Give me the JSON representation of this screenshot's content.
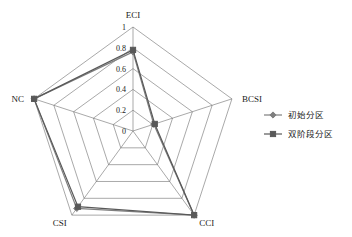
{
  "chart_data": {
    "type": "radar",
    "title": "",
    "categories": [
      "ECI",
      "BCSI",
      "CCI",
      "CSI",
      "NC"
    ],
    "tick_labels": [
      "0",
      "0.2",
      "0.4",
      "0.6",
      "0.8",
      "1"
    ],
    "ticks": [
      0,
      0.2,
      0.4,
      0.6,
      0.8,
      1
    ],
    "rlim": [
      0,
      1
    ],
    "grid": true,
    "legend_position": "right",
    "series": [
      {
        "name": "初始分区",
        "marker": "diamond",
        "color": "#7f7f7f",
        "values": [
          0.76,
          0.21,
          1.0,
          0.92,
          1.0
        ]
      },
      {
        "name": "双阶段分区",
        "marker": "square",
        "color": "#595959",
        "values": [
          0.78,
          0.22,
          1.0,
          0.9,
          1.0
        ]
      }
    ]
  },
  "axes": {
    "labels": [
      {
        "name": "ECI"
      },
      {
        "name": "BCSI"
      },
      {
        "name": "CCI"
      },
      {
        "name": "CSI"
      },
      {
        "name": "NC"
      }
    ]
  },
  "ticks": {
    "t0": "0",
    "t1": "0.2",
    "t2": "0.4",
    "t3": "0.6",
    "t4": "0.8",
    "t5": "1"
  },
  "legend": {
    "items": [
      {
        "label": "初始分区",
        "marker": "diamond-marker",
        "color": "#7f7f7f"
      },
      {
        "label": "双阶段分区",
        "marker": "square-marker",
        "color": "#595959"
      }
    ]
  },
  "colors": {
    "grid": "#6f6f6f",
    "series1": "#7f7f7f",
    "series2": "#595959",
    "text": "#1a1a1a",
    "background": "#ffffff"
  }
}
